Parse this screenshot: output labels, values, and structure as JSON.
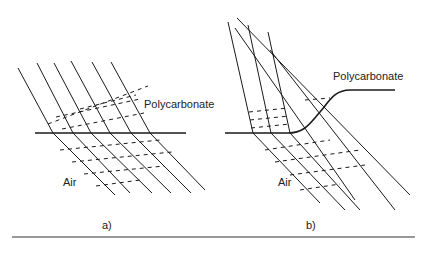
{
  "panel_a": {
    "label_upper": "Polycarbonate",
    "label_lower": "Air",
    "caption": "a)"
  },
  "panel_b": {
    "label_upper": "Polycarbonate",
    "label_lower": "Air",
    "caption": "b)"
  },
  "colors": {
    "line": "#1a1a1a",
    "background": "#ffffff"
  }
}
